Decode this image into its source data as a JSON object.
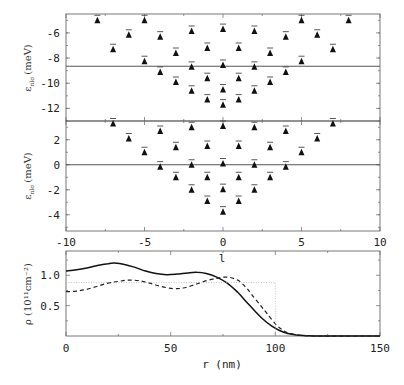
{
  "chart_data": [
    {
      "type": "scatter",
      "panel": "upper",
      "ylabel": "ε_nlσ (meV)",
      "ylabel_main": "ε",
      "ylabel_sub": "nlσ",
      "ylabel_unit": "(meV)",
      "xlim": [
        -10,
        10
      ],
      "ylim": [
        -13,
        -4.5
      ],
      "yticks": [
        -6,
        -8,
        -10,
        -12
      ],
      "ytick_labels": [
        "-6",
        "-8",
        "-10",
        "-12"
      ],
      "reference_line_y": -8.65,
      "series": [
        {
          "name": "levels",
          "points": [
            [
              -8,
              -5.0
            ],
            [
              -6,
              -6.15
            ],
            [
              -7,
              -7.3
            ],
            [
              -5,
              -5.0
            ],
            [
              -5,
              -8.25
            ],
            [
              -4,
              -6.3
            ],
            [
              -4,
              -9.1
            ],
            [
              -3,
              -7.6
            ],
            [
              -3,
              -9.9
            ],
            [
              -2,
              -5.85
            ],
            [
              -2,
              -8.7
            ],
            [
              -2,
              -10.6
            ],
            [
              -1,
              -7.2
            ],
            [
              -1,
              -9.6
            ],
            [
              -1,
              -11.3
            ],
            [
              0,
              -5.7
            ],
            [
              0,
              -8.55
            ],
            [
              0,
              -10.5
            ],
            [
              0,
              -11.7
            ],
            [
              1,
              -7.2
            ],
            [
              1,
              -9.6
            ],
            [
              1,
              -11.3
            ],
            [
              2,
              -5.85
            ],
            [
              2,
              -8.7
            ],
            [
              2,
              -10.6
            ],
            [
              3,
              -7.6
            ],
            [
              3,
              -9.9
            ],
            [
              4,
              -6.3
            ],
            [
              4,
              -9.1
            ],
            [
              5,
              -5.0
            ],
            [
              5,
              -8.25
            ],
            [
              6,
              -6.15
            ],
            [
              7,
              -7.3
            ],
            [
              8,
              -5.0
            ]
          ]
        }
      ]
    },
    {
      "type": "scatter",
      "panel": "middle",
      "ylabel": "ε_nlσ (meV)",
      "ylabel_main": "ε",
      "ylabel_sub": "nlσ",
      "ylabel_unit": "(meV)",
      "xlabel": "l",
      "xlim": [
        -10,
        10
      ],
      "ylim": [
        -5.3,
        3.5
      ],
      "xticks": [
        -10,
        -5,
        0,
        5,
        10
      ],
      "xtick_labels": [
        "-10",
        "-5",
        "0",
        "5",
        "10"
      ],
      "yticks": [
        2,
        0,
        -2,
        -4
      ],
      "ytick_labels": [
        "2",
        "0",
        "-2",
        "-4"
      ],
      "reference_line_y": 0,
      "series": [
        {
          "name": "levels",
          "points": [
            [
              -7,
              3.3
            ],
            [
              -6,
              2.1
            ],
            [
              -5,
              1.0
            ],
            [
              -4,
              2.7
            ],
            [
              -4,
              -0.15
            ],
            [
              -3,
              1.4
            ],
            [
              -3,
              -1.0
            ],
            [
              -2,
              3.0
            ],
            [
              -2,
              0.0
            ],
            [
              -2,
              -2.0
            ],
            [
              -1,
              1.5
            ],
            [
              -1,
              -1.0
            ],
            [
              -1,
              -2.9
            ],
            [
              0,
              3.1
            ],
            [
              0,
              0.1
            ],
            [
              0,
              -1.95
            ],
            [
              0,
              -3.75
            ],
            [
              1,
              1.5
            ],
            [
              1,
              -1.0
            ],
            [
              1,
              -2.9
            ],
            [
              2,
              3.0
            ],
            [
              2,
              0.0
            ],
            [
              2,
              -2.0
            ],
            [
              3,
              1.4
            ],
            [
              3,
              -1.0
            ],
            [
              4,
              2.7
            ],
            [
              4,
              -0.15
            ],
            [
              5,
              1.0
            ],
            [
              6,
              2.1
            ],
            [
              7,
              3.3
            ]
          ]
        }
      ]
    },
    {
      "type": "line",
      "panel": "lower",
      "ylabel": "ρ (10¹¹cm⁻²)",
      "xlabel": "r (nm)",
      "xlim": [
        0,
        150
      ],
      "ylim": [
        0,
        1.4
      ],
      "xticks": [
        0,
        50,
        100,
        150
      ],
      "xtick_labels": [
        "0",
        "50",
        "100",
        "150"
      ],
      "yticks": [
        1.0,
        0.5
      ],
      "ytick_labels": [
        "1.0",
        "0.5"
      ],
      "series": [
        {
          "name": "solid",
          "style": "solid",
          "x": [
            0,
            5,
            10,
            15,
            20,
            23,
            28,
            33,
            38,
            43,
            48,
            53,
            58,
            62.5,
            67,
            72,
            77,
            82,
            86,
            90,
            94,
            98,
            102,
            106,
            110,
            115,
            120,
            150
          ],
          "y": [
            1.07,
            1.09,
            1.12,
            1.16,
            1.19,
            1.2,
            1.18,
            1.13,
            1.07,
            1.03,
            1.01,
            1.02,
            1.04,
            1.05,
            1.03,
            0.97,
            0.87,
            0.72,
            0.57,
            0.42,
            0.28,
            0.17,
            0.09,
            0.04,
            0.015,
            0.005,
            0,
            0
          ]
        },
        {
          "name": "dashed",
          "style": "dashed",
          "x": [
            0,
            5,
            10,
            15,
            20,
            25,
            30,
            35,
            40,
            45,
            51,
            56,
            61,
            66,
            72,
            77,
            82,
            86,
            89,
            93,
            96,
            100,
            103,
            106,
            110,
            115,
            120,
            150
          ],
          "y": [
            0.73,
            0.74,
            0.77,
            0.82,
            0.87,
            0.9,
            0.92,
            0.91,
            0.87,
            0.82,
            0.78,
            0.79,
            0.84,
            0.9,
            0.95,
            0.97,
            0.92,
            0.8,
            0.67,
            0.5,
            0.37,
            0.2,
            0.11,
            0.05,
            0.02,
            0.005,
            0,
            0
          ]
        },
        {
          "name": "reference",
          "style": "dotted",
          "x": [
            0,
            100,
            100
          ],
          "y": [
            0.88,
            0.88,
            0
          ]
        }
      ]
    }
  ]
}
